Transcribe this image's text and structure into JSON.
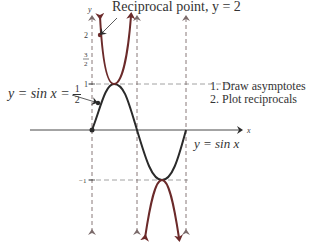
{
  "figure": {
    "annotations": {
      "reciprocal_point": "Reciprocal point, y = 2",
      "sin_half_lhs": "y = sin x =",
      "sin_half_num": "1",
      "sin_half_den": "2",
      "curve_label": "y = sin x"
    },
    "steps": [
      "1.  Draw asymptotes",
      "2.  Plot reciprocals"
    ],
    "axes": {
      "x_label": "x",
      "y_label": "y"
    },
    "ticks": {
      "y_2": "2",
      "y_3half_num": "3",
      "y_3half_den": "2",
      "y_1": "1",
      "y_neg1": "−1"
    },
    "colors": {
      "sine": "#2a2a2a",
      "cosecant": "#6b2a2a",
      "asymptote": "#7a6a6a",
      "axis": "#333333"
    }
  }
}
